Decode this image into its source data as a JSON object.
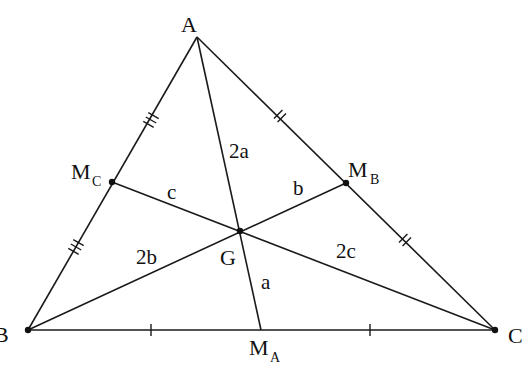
{
  "diagram": {
    "vertices": {
      "A": {
        "label": "A"
      },
      "B": {
        "label": "B"
      },
      "C": {
        "label": "C"
      }
    },
    "midpoints": {
      "MA": {
        "label": "M",
        "sub": "A"
      },
      "MB": {
        "label": "M",
        "sub": "B"
      },
      "MC": {
        "label": "M",
        "sub": "C"
      }
    },
    "centroid": {
      "label": "G"
    },
    "segments": {
      "AG": "2a",
      "GMA": "a",
      "BG": "2b",
      "GMB": "b",
      "CG": "2c",
      "GMC": "c"
    },
    "colors": {
      "stroke": "#1a1a1a",
      "background": "#ffffff"
    }
  }
}
